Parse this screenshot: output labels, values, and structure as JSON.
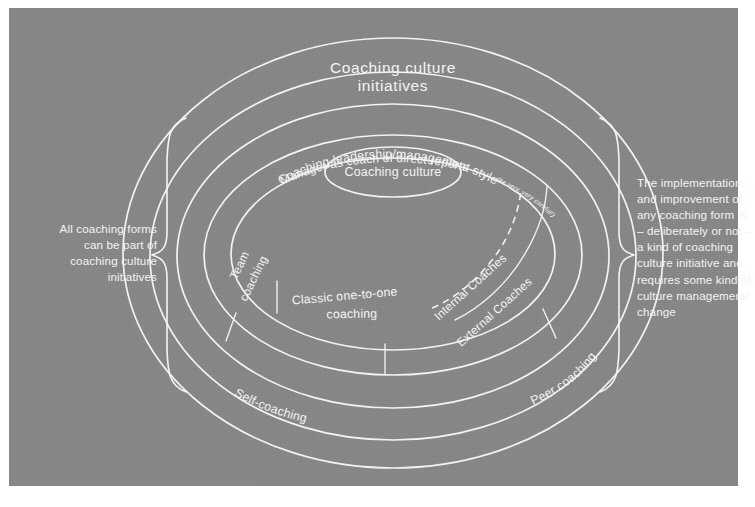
{
  "diagram": {
    "title": "Coaching culture initiatives",
    "core_label": "Coaching culture",
    "rings": [
      {
        "id": "coaching-leadership",
        "label": "Coaching leadership/management style"
      },
      {
        "id": "manager-as-coach",
        "label": "Manager as coach of direct reports",
        "note": "(Be very, very careful!)"
      }
    ],
    "segments": [
      {
        "id": "team-coaching",
        "label": "Team\ncoaching"
      },
      {
        "id": "classic-one-to-one",
        "label": "Classic one-to-one\ncoaching"
      },
      {
        "id": "internal-coaches",
        "label": "Internal Coaches"
      },
      {
        "id": "external-coaches",
        "label": "External Coaches"
      },
      {
        "id": "peer-coaching",
        "label": "Peer coaching"
      },
      {
        "id": "self-coaching",
        "label": "Self-coaching"
      }
    ],
    "annotations": {
      "left": "All coaching forms\ncan be part of\ncoaching culture\ninitiatives",
      "right": "The implementation\nand improvement of\nany coaching form is\n– deliberately or not –\na kind of coaching\nculture initiative and\nrequires some kind of\nculture management/\nchange"
    },
    "colors": {
      "canvas": "#878787",
      "stroke": "#f2f2f2",
      "page": "#ffffff"
    }
  }
}
